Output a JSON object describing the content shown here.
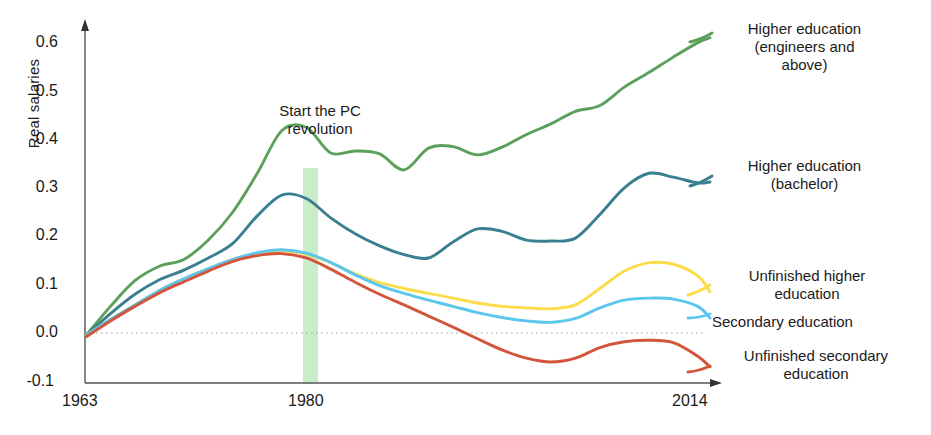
{
  "chart_data": {
    "type": "line",
    "title": "",
    "xlabel": "",
    "ylabel": "Real salaries",
    "xlim": [
      1963,
      2014
    ],
    "ylim": [
      -0.1,
      0.62
    ],
    "xticks": [
      "1963",
      "1980",
      "2014"
    ],
    "xtick_values": [
      1963,
      1980,
      2014
    ],
    "yticks": [
      "0.6",
      "0.5",
      "0.4",
      "0.3",
      "0.2",
      "0.1",
      "0.0",
      "-0.1"
    ],
    "ytick_values": [
      0.6,
      0.5,
      0.4,
      0.3,
      0.2,
      0.1,
      0.0,
      -0.1
    ],
    "grid": false,
    "zero_line": true,
    "zero_line_style": "dotted",
    "legend_position": "right-outside",
    "annotations": [
      {
        "text": "Start the PC revolution",
        "x": 1980,
        "type": "vertical-band",
        "band_color": "#a8e0a8",
        "band_from": 1979,
        "band_to": 1981
      }
    ],
    "x": [
      1963,
      1965,
      1967,
      1969,
      1971,
      1973,
      1975,
      1977,
      1979,
      1981,
      1983,
      1985,
      1987,
      1989,
      1991,
      1993,
      1995,
      1997,
      1999,
      2001,
      2003,
      2005,
      2007,
      2009,
      2011,
      2013,
      2014
    ],
    "series": [
      {
        "name": "Higher education (engineers and above)",
        "color": "#5aa05a",
        "values": [
          -0.005,
          0.055,
          0.108,
          0.138,
          0.152,
          0.192,
          0.25,
          0.33,
          0.418,
          0.425,
          0.372,
          0.376,
          0.37,
          0.337,
          0.382,
          0.385,
          0.368,
          0.384,
          0.41,
          0.432,
          0.458,
          0.47,
          0.508,
          0.538,
          0.57,
          0.6,
          0.61
        ]
      },
      {
        "name": "Higher education (bachelor)",
        "color": "#3a7f90",
        "values": [
          -0.005,
          0.04,
          0.08,
          0.11,
          0.13,
          0.155,
          0.185,
          0.242,
          0.285,
          0.278,
          0.238,
          0.205,
          0.18,
          0.162,
          0.155,
          0.188,
          0.215,
          0.21,
          0.192,
          0.19,
          0.196,
          0.245,
          0.3,
          0.33,
          0.322,
          0.31,
          0.312
        ]
      },
      {
        "name": "Unfinished higher education",
        "color": "#fbdc4a",
        "values": [
          -0.005,
          0.028,
          0.058,
          0.088,
          0.112,
          0.133,
          0.152,
          0.165,
          0.17,
          0.163,
          0.145,
          0.122,
          0.104,
          0.092,
          0.082,
          0.072,
          0.062,
          0.055,
          0.052,
          0.05,
          0.058,
          0.092,
          0.128,
          0.145,
          0.142,
          0.118,
          0.085
        ]
      },
      {
        "name": "Secondary education",
        "color": "#5bc6ee",
        "values": [
          -0.005,
          0.028,
          0.058,
          0.088,
          0.112,
          0.133,
          0.152,
          0.166,
          0.172,
          0.165,
          0.146,
          0.12,
          0.098,
          0.082,
          0.068,
          0.055,
          0.042,
          0.032,
          0.025,
          0.022,
          0.03,
          0.052,
          0.068,
          0.072,
          0.07,
          0.055,
          0.031
        ]
      },
      {
        "name": "Unfinished secondary education",
        "color": "#d2553c",
        "values": [
          -0.008,
          0.025,
          0.055,
          0.083,
          0.106,
          0.128,
          0.148,
          0.16,
          0.164,
          0.155,
          0.132,
          0.105,
          0.08,
          0.058,
          0.035,
          0.012,
          -0.012,
          -0.035,
          -0.052,
          -0.06,
          -0.052,
          -0.03,
          -0.018,
          -0.015,
          -0.02,
          -0.048,
          -0.07
        ]
      }
    ]
  },
  "axis": {
    "y_title": "Real salaries",
    "yticks": [
      "0.6",
      "0.5",
      "0.4",
      "0.3",
      "0.2",
      "0.1",
      "0.0",
      "-0.1"
    ],
    "xticks": [
      "1963",
      "1980",
      "2014"
    ]
  },
  "annotation": {
    "line1": "Start the PC",
    "line2": "revolution"
  },
  "legend": {
    "items": [
      {
        "label": "Higher education (engineers and above)",
        "line1": "Higher education",
        "line2": "(engineers and",
        "line3": "above)",
        "color": "#5aa05a"
      },
      {
        "label": "Higher education (bachelor)",
        "line1": "Higher education",
        "line2": "(bachelor)",
        "line3": "",
        "color": "#3a7f90"
      },
      {
        "label": "Unfinished higher education",
        "line1": "Unfinished higher",
        "line2": "education",
        "line3": "",
        "color": "#fbdc4a"
      },
      {
        "label": "Secondary education",
        "line1": "Secondary education",
        "line2": "",
        "line3": "",
        "color": "#5bc6ee"
      },
      {
        "label": "Unfinished secondary education",
        "line1": "Unfinished secondary",
        "line2": "education",
        "line3": "",
        "color": "#d2553c"
      }
    ]
  }
}
